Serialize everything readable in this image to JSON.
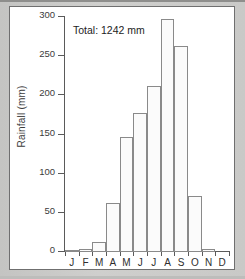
{
  "chart_data": {
    "type": "bar",
    "title": "",
    "subtitle": "",
    "xlabel": "",
    "ylabel": "Rainfall (mm)",
    "categories": [
      "J",
      "F",
      "M",
      "A",
      "M",
      "J",
      "J",
      "A",
      "S",
      "O",
      "N",
      "D"
    ],
    "category_names": [
      "January",
      "February",
      "March",
      "April",
      "May",
      "June",
      "July",
      "August",
      "September",
      "October",
      "November",
      "December"
    ],
    "values": [
      2,
      4,
      13,
      62,
      147,
      177,
      212,
      297,
      263,
      72,
      4,
      0
    ],
    "ylim": [
      0,
      300
    ],
    "yticks": [
      0,
      50,
      100,
      150,
      200,
      250,
      300
    ],
    "ytick_labels": [
      "0",
      "50",
      "100",
      "150",
      "200",
      "250",
      "300"
    ],
    "grid": false,
    "legend": false,
    "legend_position": "none",
    "annotations": [
      {
        "name": "total-annotation",
        "text": "Total: 1242 mm"
      }
    ],
    "series": [
      {
        "name": "Rainfall",
        "values": [
          2,
          4,
          13,
          62,
          147,
          177,
          212,
          297,
          263,
          72,
          4,
          0
        ]
      }
    ],
    "colors": {
      "bar_fill": "#fbfbfb",
      "bar_edge": "#8a8a8a",
      "axis": "#5a5a5a",
      "text": "#2e2e2e",
      "panel_background": "#ffffff",
      "page_background": "#c8c8c6"
    }
  }
}
